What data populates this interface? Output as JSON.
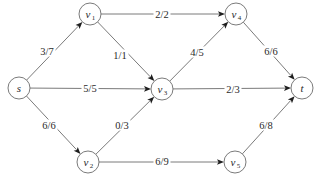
{
  "diagram": {
    "type": "flow-network",
    "nodes": [
      {
        "id": "s",
        "label": "s",
        "sub": "",
        "x": 19,
        "y": 88
      },
      {
        "id": "v1",
        "label": "v",
        "sub": "1",
        "x": 90,
        "y": 14
      },
      {
        "id": "v2",
        "label": "v",
        "sub": "2",
        "x": 88,
        "y": 162
      },
      {
        "id": "v3",
        "label": "v",
        "sub": "3",
        "x": 162,
        "y": 89
      },
      {
        "id": "v4",
        "label": "v",
        "sub": "4",
        "x": 236,
        "y": 14
      },
      {
        "id": "v5",
        "label": "v",
        "sub": "5",
        "x": 235,
        "y": 162
      },
      {
        "id": "t",
        "label": "t",
        "sub": "",
        "x": 302,
        "y": 88
      }
    ],
    "edges": [
      {
        "from": "s",
        "to": "v1",
        "label": "3/7",
        "flow": 3,
        "capacity": 7,
        "lx": 47,
        "ly": 51
      },
      {
        "from": "s",
        "to": "v3",
        "label": "5/5",
        "flow": 5,
        "capacity": 5,
        "lx": 90,
        "ly": 88
      },
      {
        "from": "s",
        "to": "v2",
        "label": "6/6",
        "flow": 6,
        "capacity": 6,
        "lx": 49,
        "ly": 125
      },
      {
        "from": "v1",
        "to": "v4",
        "label": "2/2",
        "flow": 2,
        "capacity": 2,
        "lx": 162,
        "ly": 14
      },
      {
        "from": "v1",
        "to": "v3",
        "label": "1/1",
        "flow": 1,
        "capacity": 1,
        "lx": 120,
        "ly": 55
      },
      {
        "from": "v2",
        "to": "v3",
        "label": "0/3",
        "flow": 0,
        "capacity": 3,
        "lx": 122,
        "ly": 125
      },
      {
        "from": "v2",
        "to": "v5",
        "label": "6/9",
        "flow": 6,
        "capacity": 9,
        "lx": 162,
        "ly": 161
      },
      {
        "from": "v3",
        "to": "v4",
        "label": "4/5",
        "flow": 4,
        "capacity": 5,
        "lx": 197,
        "ly": 52
      },
      {
        "from": "v3",
        "to": "t",
        "label": "2/3",
        "flow": 2,
        "capacity": 3,
        "lx": 233,
        "ly": 89
      },
      {
        "from": "v4",
        "to": "t",
        "label": "6/6",
        "flow": 6,
        "capacity": 6,
        "lx": 271,
        "ly": 51
      },
      {
        "from": "v5",
        "to": "t",
        "label": "6/8",
        "flow": 6,
        "capacity": 8,
        "lx": 266,
        "ly": 125
      }
    ],
    "node_radius": 11,
    "colors": {
      "line": "#6b6b6b",
      "arrow": "#1e1e1e",
      "text": "#2a2a2a",
      "background": "#ffffff"
    }
  }
}
